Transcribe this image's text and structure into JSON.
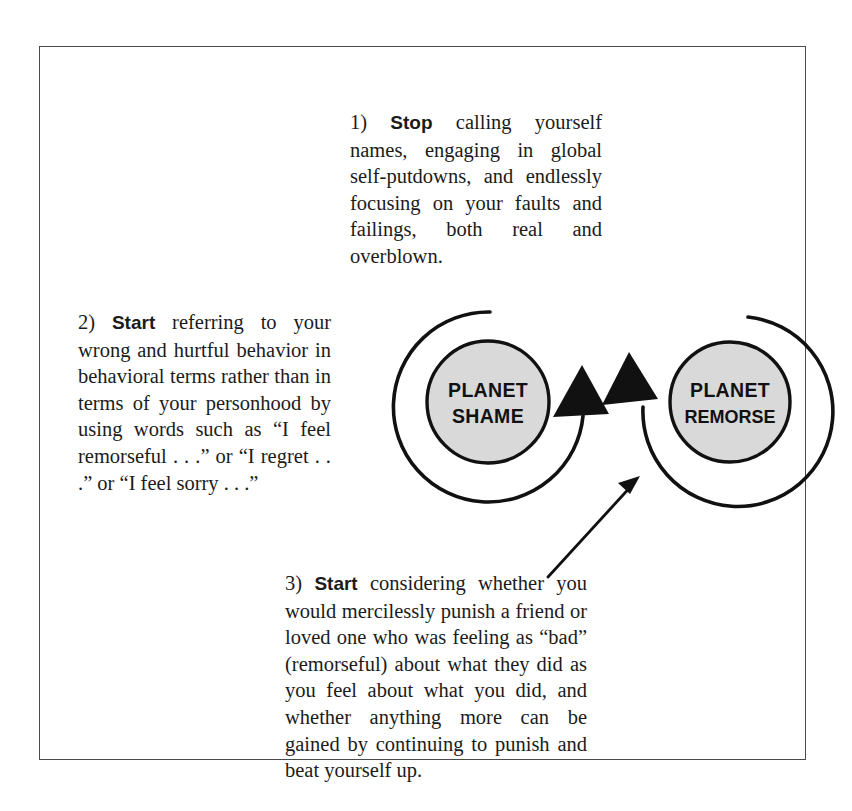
{
  "figure": {
    "border_color": "#4a4a4a",
    "background": "#ffffff"
  },
  "blocks": [
    {
      "id": "block-1",
      "number": "1)",
      "keyword": "Stop",
      "text": " calling yourself names, engaging in global self-putdowns, and endlessly focusing on your faults and failings, both real and overblown."
    },
    {
      "id": "block-2",
      "number": "2)",
      "keyword": "Start",
      "text": " referring to your wrong and hurtful behavior in behavioral terms rather than in terms of your personhood by using words such as “I feel remorseful . . .” or “I regret . . .” or “I feel sorry . . .”"
    },
    {
      "id": "block-3",
      "number": "3)",
      "keyword": "Start",
      "text": " considering whether you would mercilessly punish a friend or loved one who was feeling as “bad” (remorseful) about what they did as you feel about what you did, and whether anything more can be gained by continuing to punish and beat yourself up."
    }
  ],
  "diagram": {
    "planets": [
      {
        "id": "planet-shame",
        "line1": "PLANET",
        "line2": "SHAME",
        "fill": "#d9d9d9",
        "stroke": "#111111"
      },
      {
        "id": "planet-remorse",
        "line1": "PLANET",
        "line2": "REMORSE",
        "fill": "#d9d9d9",
        "stroke": "#111111"
      }
    ],
    "arc_color": "#111111",
    "arrow_color": "#111111"
  }
}
